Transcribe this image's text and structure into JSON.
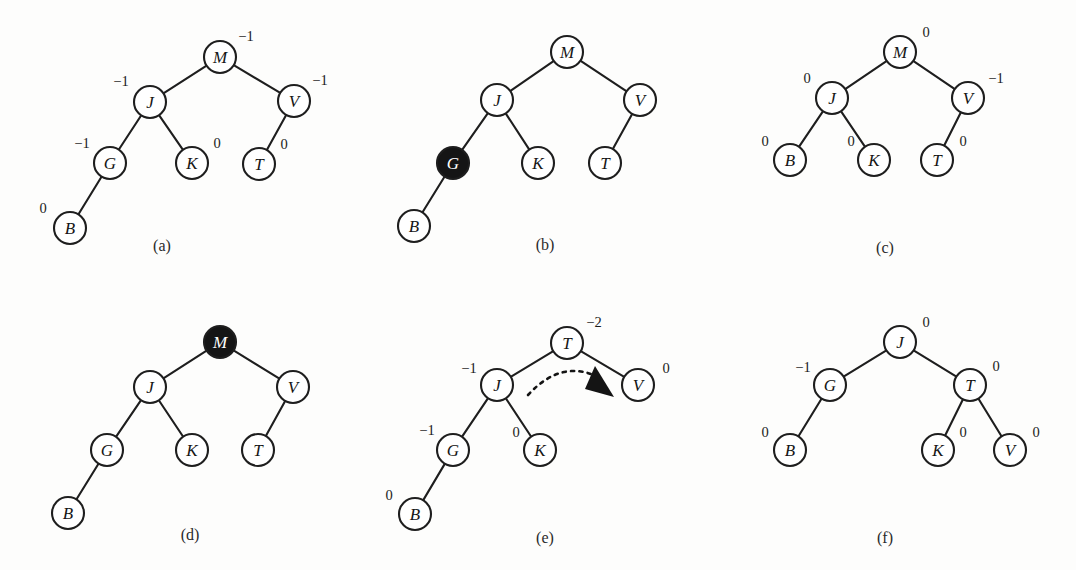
{
  "figure": {
    "background_color": "#fdfdfc",
    "node_fill": "#ffffff",
    "node_highlight_fill": "#151515",
    "stroke_color": "#1e1e1e",
    "node_radius": 16
  },
  "panels": [
    {
      "id": "a",
      "caption": "(a)",
      "caption_pos": {
        "x": 162,
        "y": 245
      },
      "nodes": [
        {
          "key": "M",
          "x": 220,
          "y": 57,
          "filled": false,
          "balance": "−1",
          "balance_pos": {
            "x": 246,
            "y": 36
          }
        },
        {
          "key": "J",
          "x": 150,
          "y": 102,
          "filled": false,
          "balance": "−1",
          "balance_pos": {
            "x": 121,
            "y": 81
          }
        },
        {
          "key": "V",
          "x": 294,
          "y": 101,
          "filled": false,
          "balance": "−1",
          "balance_pos": {
            "x": 320,
            "y": 80
          }
        },
        {
          "key": "G",
          "x": 110,
          "y": 163,
          "filled": false,
          "balance": "−1",
          "balance_pos": {
            "x": 82,
            "y": 143
          }
        },
        {
          "key": "K",
          "x": 192,
          "y": 163,
          "filled": false,
          "balance": "0",
          "balance_pos": {
            "x": 217,
            "y": 143
          }
        },
        {
          "key": "T",
          "x": 259,
          "y": 164,
          "filled": false,
          "balance": "0",
          "balance_pos": {
            "x": 284,
            "y": 144
          }
        },
        {
          "key": "B",
          "x": 70,
          "y": 228,
          "filled": false,
          "balance": "0",
          "balance_pos": {
            "x": 43,
            "y": 208
          }
        }
      ],
      "edges": [
        [
          "M",
          "J"
        ],
        [
          "M",
          "V"
        ],
        [
          "J",
          "G"
        ],
        [
          "J",
          "K"
        ],
        [
          "V",
          "T"
        ],
        [
          "G",
          "B"
        ]
      ],
      "rotation_arrow": null
    },
    {
      "id": "b",
      "caption": "(b)",
      "caption_pos": {
        "x": 545,
        "y": 244
      },
      "nodes": [
        {
          "key": "M",
          "x": 567,
          "y": 52,
          "filled": false,
          "balance": null,
          "balance_pos": null
        },
        {
          "key": "J",
          "x": 497,
          "y": 100,
          "filled": false,
          "balance": null,
          "balance_pos": null
        },
        {
          "key": "V",
          "x": 640,
          "y": 100,
          "filled": false,
          "balance": null,
          "balance_pos": null
        },
        {
          "key": "G",
          "x": 453,
          "y": 163,
          "filled": true,
          "balance": null,
          "balance_pos": null
        },
        {
          "key": "K",
          "x": 538,
          "y": 163,
          "filled": false,
          "balance": null,
          "balance_pos": null
        },
        {
          "key": "T",
          "x": 605,
          "y": 163,
          "filled": false,
          "balance": null,
          "balance_pos": null
        },
        {
          "key": "B",
          "x": 414,
          "y": 226,
          "filled": false,
          "balance": null,
          "balance_pos": null
        }
      ],
      "edges": [
        [
          "M",
          "J"
        ],
        [
          "M",
          "V"
        ],
        [
          "J",
          "G"
        ],
        [
          "J",
          "K"
        ],
        [
          "V",
          "T"
        ],
        [
          "G",
          "B"
        ]
      ],
      "rotation_arrow": null
    },
    {
      "id": "c",
      "caption": "(c)",
      "caption_pos": {
        "x": 885,
        "y": 247
      },
      "nodes": [
        {
          "key": "M",
          "x": 900,
          "y": 52,
          "filled": false,
          "balance": "0",
          "balance_pos": {
            "x": 926,
            "y": 32
          }
        },
        {
          "key": "J",
          "x": 832,
          "y": 98,
          "filled": false,
          "balance": "0",
          "balance_pos": {
            "x": 807,
            "y": 78
          }
        },
        {
          "key": "V",
          "x": 968,
          "y": 98,
          "filled": false,
          "balance": "−1",
          "balance_pos": {
            "x": 996,
            "y": 78
          }
        },
        {
          "key": "B",
          "x": 790,
          "y": 160,
          "filled": false,
          "balance": "0",
          "balance_pos": {
            "x": 765,
            "y": 141
          }
        },
        {
          "key": "K",
          "x": 874,
          "y": 160,
          "filled": false,
          "balance": "0",
          "balance_pos": {
            "x": 851,
            "y": 141
          }
        },
        {
          "key": "T",
          "x": 937,
          "y": 160,
          "filled": false,
          "balance": "0",
          "balance_pos": {
            "x": 963,
            "y": 141
          }
        }
      ],
      "edges": [
        [
          "M",
          "J"
        ],
        [
          "M",
          "V"
        ],
        [
          "J",
          "B"
        ],
        [
          "J",
          "K"
        ],
        [
          "V",
          "T"
        ]
      ],
      "rotation_arrow": null
    },
    {
      "id": "d",
      "caption": "(d)",
      "caption_pos": {
        "x": 190,
        "y": 534
      },
      "nodes": [
        {
          "key": "M",
          "x": 220,
          "y": 342,
          "filled": true,
          "balance": null,
          "balance_pos": null
        },
        {
          "key": "J",
          "x": 150,
          "y": 387,
          "filled": false,
          "balance": null,
          "balance_pos": null
        },
        {
          "key": "V",
          "x": 293,
          "y": 387,
          "filled": false,
          "balance": null,
          "balance_pos": null
        },
        {
          "key": "G",
          "x": 107,
          "y": 450,
          "filled": false,
          "balance": null,
          "balance_pos": null
        },
        {
          "key": "K",
          "x": 192,
          "y": 450,
          "filled": false,
          "balance": null,
          "balance_pos": null
        },
        {
          "key": "T",
          "x": 258,
          "y": 450,
          "filled": false,
          "balance": null,
          "balance_pos": null
        },
        {
          "key": "B",
          "x": 68,
          "y": 513,
          "filled": false,
          "balance": null,
          "balance_pos": null
        }
      ],
      "edges": [
        [
          "M",
          "J"
        ],
        [
          "M",
          "V"
        ],
        [
          "J",
          "G"
        ],
        [
          "J",
          "K"
        ],
        [
          "V",
          "T"
        ],
        [
          "G",
          "B"
        ]
      ],
      "rotation_arrow": null
    },
    {
      "id": "e",
      "caption": "(e)",
      "caption_pos": {
        "x": 545,
        "y": 537
      },
      "nodes": [
        {
          "key": "T",
          "x": 567,
          "y": 343,
          "filled": false,
          "balance": "−2",
          "balance_pos": {
            "x": 594,
            "y": 322
          }
        },
        {
          "key": "J",
          "x": 497,
          "y": 385,
          "filled": false,
          "balance": "−1",
          "balance_pos": {
            "x": 469,
            "y": 368
          }
        },
        {
          "key": "V",
          "x": 638,
          "y": 385,
          "filled": false,
          "balance": "0",
          "balance_pos": {
            "x": 666,
            "y": 368
          }
        },
        {
          "key": "G",
          "x": 453,
          "y": 450,
          "filled": false,
          "balance": "−1",
          "balance_pos": {
            "x": 427,
            "y": 430
          }
        },
        {
          "key": "K",
          "x": 540,
          "y": 450,
          "filled": false,
          "balance": "0",
          "balance_pos": {
            "x": 516,
            "y": 432
          }
        },
        {
          "key": "B",
          "x": 415,
          "y": 514,
          "filled": false,
          "balance": "0",
          "balance_pos": {
            "x": 389,
            "y": 495
          }
        }
      ],
      "edges": [
        [
          "T",
          "J"
        ],
        [
          "T",
          "V"
        ],
        [
          "J",
          "G"
        ],
        [
          "J",
          "K"
        ],
        [
          "G",
          "B"
        ]
      ],
      "rotation_arrow": {
        "label": "left-rotation-arrow",
        "path": "M 528 395 Q 562 358 600 378",
        "head": "M 595 366 L 614 397 L 585 389 Z"
      }
    },
    {
      "id": "f",
      "caption": "(f)",
      "caption_pos": {
        "x": 885,
        "y": 537
      },
      "nodes": [
        {
          "key": "J",
          "x": 900,
          "y": 342,
          "filled": false,
          "balance": "0",
          "balance_pos": {
            "x": 926,
            "y": 322
          }
        },
        {
          "key": "G",
          "x": 830,
          "y": 385,
          "filled": false,
          "balance": "−1",
          "balance_pos": {
            "x": 803,
            "y": 367
          }
        },
        {
          "key": "T",
          "x": 970,
          "y": 385,
          "filled": false,
          "balance": "0",
          "balance_pos": {
            "x": 996,
            "y": 366
          }
        },
        {
          "key": "B",
          "x": 790,
          "y": 450,
          "filled": false,
          "balance": "0",
          "balance_pos": {
            "x": 765,
            "y": 432
          }
        },
        {
          "key": "K",
          "x": 938,
          "y": 450,
          "filled": false,
          "balance": "0",
          "balance_pos": {
            "x": 963,
            "y": 432
          }
        },
        {
          "key": "V",
          "x": 1010,
          "y": 450,
          "filled": false,
          "balance": "0",
          "balance_pos": {
            "x": 1036,
            "y": 432
          }
        }
      ],
      "edges": [
        [
          "J",
          "G"
        ],
        [
          "J",
          "T"
        ],
        [
          "G",
          "B"
        ],
        [
          "T",
          "K"
        ],
        [
          "T",
          "V"
        ]
      ],
      "rotation_arrow": null
    }
  ]
}
